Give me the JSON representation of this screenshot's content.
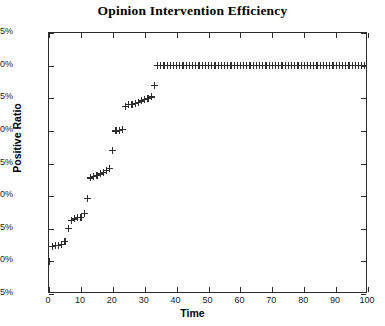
{
  "chart_data": {
    "type": "scatter",
    "title": "Opinion Intervention Efficiency",
    "xlabel": "Time",
    "ylabel": "Positive Ratio",
    "marker": "+",
    "marker_color": "#2e2e2e",
    "grid": false,
    "legend": null,
    "xlim": [
      0,
      100
    ],
    "ylim": [
      15,
      55
    ],
    "xticks": [
      0,
      10,
      20,
      30,
      40,
      50,
      60,
      70,
      80,
      90,
      100
    ],
    "xtick_labels": [
      "0",
      "10",
      "20",
      "30",
      "40",
      "50",
      "60",
      "70",
      "80",
      "90",
      "100"
    ],
    "yticks": [
      15,
      20,
      25,
      30,
      35,
      40,
      45,
      50,
      55
    ],
    "ytick_labels": [
      "15%",
      "20%",
      "25%",
      "30%",
      "35%",
      "40%",
      "45%",
      "50%",
      "55%"
    ],
    "series": [
      {
        "name": "Positive Ratio",
        "x": [
          0,
          1,
          2,
          3,
          4,
          5,
          6,
          7,
          8,
          9,
          10,
          11,
          12,
          13,
          14,
          15,
          16,
          17,
          18,
          19,
          20,
          21,
          22,
          23,
          24,
          25,
          26,
          27,
          28,
          29,
          30,
          31,
          32,
          33,
          34,
          35,
          36,
          37,
          38,
          39,
          40,
          41,
          42,
          43,
          44,
          45,
          46,
          47,
          48,
          49,
          50,
          51,
          52,
          53,
          54,
          55,
          56,
          57,
          58,
          59,
          60,
          61,
          62,
          63,
          64,
          65,
          66,
          67,
          68,
          69,
          70,
          71,
          72,
          73,
          74,
          75,
          76,
          77,
          78,
          79,
          80,
          81,
          82,
          83,
          84,
          85,
          86,
          87,
          88,
          89,
          90,
          91,
          92,
          93,
          94,
          95,
          96,
          97,
          98,
          99,
          100
        ],
        "y": [
          20.0,
          22.3,
          22.4,
          22.5,
          22.6,
          23.1,
          25.0,
          26.3,
          26.5,
          26.7,
          26.8,
          27.4,
          29.6,
          32.8,
          33.0,
          33.2,
          33.4,
          33.6,
          34.0,
          34.2,
          37.0,
          40.0,
          40.1,
          40.2,
          43.8,
          44.0,
          44.1,
          44.2,
          44.4,
          44.6,
          44.8,
          45.0,
          45.2,
          47.0,
          50.0,
          50.0,
          50.0,
          50.0,
          50.0,
          50.0,
          50.0,
          50.0,
          50.0,
          50.0,
          50.0,
          50.0,
          50.0,
          50.0,
          50.0,
          50.0,
          50.0,
          50.0,
          50.0,
          50.0,
          50.0,
          50.0,
          50.0,
          50.0,
          50.0,
          50.0,
          50.0,
          50.0,
          50.0,
          50.0,
          50.0,
          50.0,
          50.0,
          50.0,
          50.0,
          50.0,
          50.0,
          50.0,
          50.0,
          50.0,
          50.0,
          50.0,
          50.0,
          50.0,
          50.0,
          50.0,
          50.0,
          50.0,
          50.0,
          50.0,
          50.0,
          50.0,
          50.0,
          50.0,
          50.0,
          50.0,
          50.0,
          50.0,
          50.0,
          50.0,
          50.0,
          50.0,
          50.0,
          50.0,
          50.0,
          50.0,
          50.0
        ]
      }
    ]
  }
}
